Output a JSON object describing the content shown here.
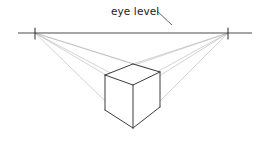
{
  "figure": {
    "kind": "two-point-perspective-construction-drawing",
    "background_color": "#ffffff"
  },
  "labels": {
    "eye_level": "eye level"
  },
  "label_positions": {
    "eye_level": {
      "x": 111,
      "y": 15
    }
  },
  "leader_line": {
    "name": "eye-level-leader",
    "x1": 157,
    "y1": 11,
    "x2": 172,
    "y2": 25,
    "color": "#555555",
    "width": 0.9
  },
  "horizon": {
    "name": "horizon-line",
    "description": "eye level / horizon line",
    "x1": 18,
    "y1": 33,
    "x2": 252,
    "y2": 33,
    "color": "#4a4a4a",
    "width": 1.0
  },
  "vanishing_points": [
    {
      "id": "vp-left",
      "label": "left vanishing point",
      "x": 35,
      "y": 33,
      "tick_top": 28,
      "tick_bottom": 39
    },
    {
      "id": "vp-right",
      "label": "right vanishing point",
      "x": 228,
      "y": 33,
      "tick_top": 28,
      "tick_bottom": 39
    }
  ],
  "cube": {
    "name": "cube",
    "stroke_color": "#3c3c3c",
    "stroke_width": 1.0,
    "fill": "none",
    "vertices": {
      "top_back": {
        "x": 133,
        "y": 64
      },
      "top_left": {
        "x": 105,
        "y": 75
      },
      "top_right": {
        "x": 160,
        "y": 72
      },
      "top_front": {
        "x": 133,
        "y": 85
      },
      "bottom_left": {
        "x": 105,
        "y": 110
      },
      "bottom_right": {
        "x": 160,
        "y": 107
      },
      "bottom_front": {
        "x": 133,
        "y": 128
      }
    },
    "faces": [
      {
        "id": "face-top",
        "label": "top face",
        "points": "133,64 105,75 133,85 160,72"
      },
      {
        "id": "face-left",
        "label": "left front face",
        "points": "105,75 105,110 133,128 133,85"
      },
      {
        "id": "face-right",
        "label": "right front face",
        "points": "133,85 133,128 160,107 160,72"
      }
    ],
    "edges": [
      {
        "id": "edge-top-back-left",
        "x1": 133,
        "y1": 64,
        "x2": 105,
        "y2": 75
      },
      {
        "id": "edge-top-back-right",
        "x1": 133,
        "y1": 64,
        "x2": 160,
        "y2": 72
      },
      {
        "id": "edge-top-front-left",
        "x1": 105,
        "y1": 75,
        "x2": 133,
        "y2": 85
      },
      {
        "id": "edge-top-front-right",
        "x1": 160,
        "y1": 72,
        "x2": 133,
        "y2": 85
      },
      {
        "id": "edge-vertical-left",
        "x1": 105,
        "y1": 75,
        "x2": 105,
        "y2": 110
      },
      {
        "id": "edge-vertical-center",
        "x1": 133,
        "y1": 85,
        "x2": 133,
        "y2": 128
      },
      {
        "id": "edge-vertical-right",
        "x1": 160,
        "y1": 72,
        "x2": 160,
        "y2": 107
      },
      {
        "id": "edge-bottom-left",
        "x1": 105,
        "y1": 110,
        "x2": 133,
        "y2": 128
      },
      {
        "id": "edge-bottom-right",
        "x1": 160,
        "y1": 107,
        "x2": 133,
        "y2": 128
      }
    ]
  },
  "construction_lines": {
    "color": "#b5b5b5",
    "width": 0.6,
    "from_left_vp": [
      {
        "id": "cl-left-to-top-back",
        "x1": 35,
        "y1": 33,
        "x2": 133,
        "y2": 64
      },
      {
        "id": "cl-left-to-top-right",
        "x1": 35,
        "y1": 33,
        "x2": 160,
        "y2": 72
      },
      {
        "id": "cl-left-to-top-front",
        "x1": 35,
        "y1": 33,
        "x2": 133,
        "y2": 85
      },
      {
        "id": "cl-left-to-bottom-right",
        "x1": 35,
        "y1": 33,
        "x2": 160,
        "y2": 107
      },
      {
        "id": "cl-left-to-bottom-front",
        "x1": 35,
        "y1": 33,
        "x2": 133,
        "y2": 128
      }
    ],
    "from_right_vp": [
      {
        "id": "cl-right-to-top-back",
        "x1": 228,
        "y1": 33,
        "x2": 133,
        "y2": 64
      },
      {
        "id": "cl-right-to-top-left",
        "x1": 228,
        "y1": 33,
        "x2": 105,
        "y2": 75
      },
      {
        "id": "cl-right-to-top-front",
        "x1": 228,
        "y1": 33,
        "x2": 133,
        "y2": 85
      },
      {
        "id": "cl-right-to-bottom-left",
        "x1": 228,
        "y1": 33,
        "x2": 105,
        "y2": 110
      },
      {
        "id": "cl-right-to-bottom-front",
        "x1": 228,
        "y1": 33,
        "x2": 133,
        "y2": 128
      }
    ]
  }
}
